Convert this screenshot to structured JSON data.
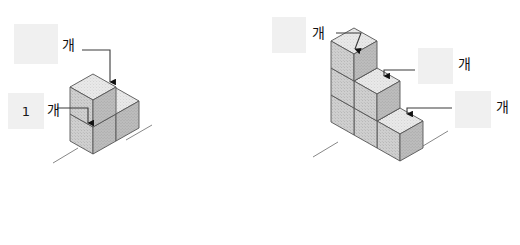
{
  "page": {
    "background_color": "#ffffff",
    "answer_box_color": "#f0f0f0",
    "line_color": "#3a3a3a",
    "cube_top_color": "#e8e8e8",
    "cube_left_color": "#c9c9c9",
    "cube_right_color": "#b4b4b4",
    "cube_edge_color": "#555555"
  },
  "figures": [
    {
      "id": "figure-left",
      "name": "left-cube-figure",
      "structure": {
        "description": "L-shaped stack of unit cubes in isometric view",
        "total_cubes": 3,
        "columns": [
          {
            "index": 1,
            "height": 1
          },
          {
            "index": 2,
            "height": 2
          }
        ]
      },
      "callouts": [
        {
          "id": "left-callout-top",
          "box_value": "",
          "unit": "개",
          "target": "top-layer-cube"
        },
        {
          "id": "left-callout-bottom",
          "box_value": "1",
          "unit": "개",
          "target": "bottom-front-cube"
        }
      ]
    },
    {
      "id": "figure-right",
      "name": "right-cube-figure",
      "structure": {
        "description": "Staircase stack of unit cubes in isometric view",
        "total_cubes": 6,
        "columns": [
          {
            "index": 1,
            "height": 3
          },
          {
            "index": 2,
            "height": 2
          },
          {
            "index": 3,
            "height": 1
          }
        ]
      },
      "callouts": [
        {
          "id": "right-callout-top",
          "box_value": "",
          "unit": "개",
          "target": "third-layer-cube"
        },
        {
          "id": "right-callout-middle",
          "box_value": "",
          "unit": "개",
          "target": "second-layer-cube"
        },
        {
          "id": "right-callout-bottom",
          "box_value": "",
          "unit": "개",
          "target": "first-layer-cube"
        }
      ]
    }
  ]
}
